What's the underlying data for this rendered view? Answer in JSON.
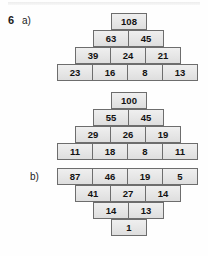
{
  "exercise": {
    "number": "6",
    "parts": [
      {
        "id": "a",
        "label": "a)"
      },
      {
        "id": "b",
        "label": "b)"
      }
    ]
  },
  "chart_data": {
    "type": "table",
    "title": "",
    "figures": [
      {
        "id": "a",
        "shape": "pyramid",
        "rows": [
          {
            "values": [
              "108"
            ]
          },
          {
            "values": [
              "63",
              "45"
            ]
          },
          {
            "values": [
              "39",
              "24",
              "21"
            ]
          },
          {
            "values": [
              "23",
              "16",
              "8",
              "13"
            ]
          }
        ]
      },
      {
        "id": "b",
        "shape": "diamond",
        "rows": [
          {
            "values": [
              "100"
            ]
          },
          {
            "values": [
              "55",
              "45"
            ]
          },
          {
            "values": [
              "29",
              "26",
              "19"
            ]
          },
          {
            "values": [
              "11",
              "18",
              "8",
              "11"
            ]
          },
          {
            "values": [
              "87",
              "46",
              "19",
              "5"
            ]
          },
          {
            "values": [
              "41",
              "27",
              "14"
            ]
          },
          {
            "values": [
              "14",
              "13"
            ]
          },
          {
            "values": [
              "1"
            ]
          }
        ]
      }
    ]
  },
  "figure_a": {
    "row1": {
      "c1": "108"
    },
    "row2": {
      "c1": "63",
      "c2": "45"
    },
    "row3": {
      "c1": "39",
      "c2": "24",
      "c3": "21"
    },
    "row4": {
      "c1": "23",
      "c2": "16",
      "c3": "8",
      "c4": "13"
    }
  },
  "figure_b": {
    "row1": {
      "c1": "100"
    },
    "row2": {
      "c1": "55",
      "c2": "45"
    },
    "row3": {
      "c1": "29",
      "c2": "26",
      "c3": "19"
    },
    "row4": {
      "c1": "11",
      "c2": "18",
      "c3": "8",
      "c4": "11"
    },
    "row5": {
      "c1": "87",
      "c2": "46",
      "c3": "19",
      "c4": "5"
    },
    "row6": {
      "c1": "41",
      "c2": "27",
      "c3": "14"
    },
    "row7": {
      "c1": "14",
      "c2": "13"
    },
    "row8": {
      "c1": "1"
    }
  },
  "colors": {
    "cell_fill": "#e6e6e6",
    "cell_border": "#6d6d6d",
    "text": "#121212",
    "page": "#fefefe"
  }
}
